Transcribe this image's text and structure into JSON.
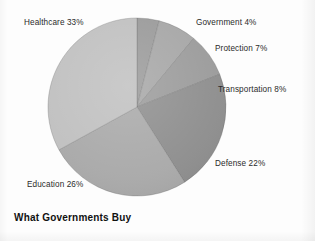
{
  "chart_data": {
    "type": "pie",
    "title": "What Governments Buy",
    "xlabel": "",
    "ylabel": "",
    "legend_position": "none",
    "grid": false,
    "labels_outside": true,
    "categories": [
      "Government",
      "Protection",
      "Transportation",
      "Defense",
      "Education",
      "Healthcare"
    ],
    "values": [
      4,
      7,
      8,
      22,
      26,
      33
    ],
    "units": "percent",
    "start_angle_deg": 0,
    "direction": "clockwise",
    "slices": [
      {
        "name": "Government",
        "value": 4,
        "label": "Government 4%",
        "color": "#9a9a9a"
      },
      {
        "name": "Protection",
        "value": 7,
        "label": "Protection 7%",
        "color": "#a6a6a6"
      },
      {
        "name": "Transportation",
        "value": 8,
        "label": "Transportation 8%",
        "color": "#9b9b9b"
      },
      {
        "name": "Defense",
        "value": 22,
        "label": "Defense 22%",
        "color": "#8e8e8e"
      },
      {
        "name": "Education",
        "value": 26,
        "label": "Education 26%",
        "color": "#a9a9a9"
      },
      {
        "name": "Healthcare",
        "value": 33,
        "label": "Healthcare 33%",
        "color": "#c0c0c0"
      }
    ]
  },
  "figure": {
    "title": "What Governments Buy",
    "background_color": "#fdfdfd",
    "label_color": "#2b2b2b",
    "title_color": "#111111"
  },
  "labels": {
    "healthcare": "Healthcare 33%",
    "government": "Government 4%",
    "protection": "Protection 7%",
    "transportation": "Transportation 8%",
    "defense": "Defense 22%",
    "education": "Education 26%"
  }
}
